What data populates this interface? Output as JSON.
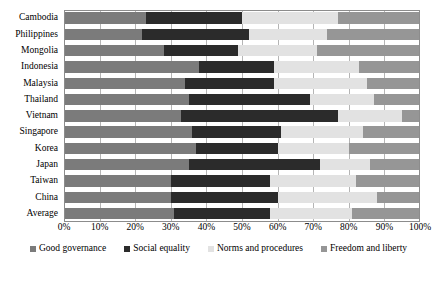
{
  "chart_data": {
    "type": "bar",
    "orientation": "horizontal",
    "stacked": true,
    "normalized_percent": true,
    "title": "",
    "subtitle": "",
    "xlabel": "",
    "ylabel": "",
    "xlim": [
      0,
      100
    ],
    "xtick_labels": [
      "0%",
      "10%",
      "20%",
      "30%",
      "40%",
      "50%",
      "60%",
      "70%",
      "80%",
      "90%",
      "100%"
    ],
    "xtick_values": [
      0,
      10,
      20,
      30,
      40,
      50,
      60,
      70,
      80,
      90,
      100
    ],
    "grid": "vertical",
    "legend_position": "bottom",
    "categories": [
      "Cambodia",
      "Philippines",
      "Mongolia",
      "Indonesia",
      "Malaysia",
      "Thailand",
      "Vietnam",
      "Singapore",
      "Korea",
      "Japan",
      "Taiwan",
      "China",
      "Average"
    ],
    "series": [
      {
        "name": "Good governance",
        "color": "#7b7b7b",
        "values": [
          23,
          22,
          28,
          38,
          34,
          35,
          33,
          36,
          37,
          35,
          30,
          30,
          31
        ]
      },
      {
        "name": "Social equality",
        "color": "#2b2b2b",
        "values": [
          27,
          30,
          21,
          21,
          25,
          34,
          44,
          25,
          23,
          37,
          28,
          30,
          27
        ]
      },
      {
        "name": "Norms and procedures",
        "color": "#e2e2e2",
        "values": [
          27,
          22,
          22,
          24,
          26,
          18,
          18,
          23,
          20,
          14,
          24,
          28,
          23
        ]
      },
      {
        "name": "Freedom and liberty",
        "color": "#969696",
        "values": [
          23,
          26,
          29,
          17,
          15,
          13,
          5,
          16,
          20,
          14,
          18,
          12,
          19
        ]
      }
    ]
  },
  "legend": {
    "items": [
      {
        "label": "Good governance",
        "color": "#7b7b7b"
      },
      {
        "label": "Social equality",
        "color": "#2b2b2b"
      },
      {
        "label": "Norms and procedures",
        "color": "#e2e2e2"
      },
      {
        "label": "Freedom and liberty",
        "color": "#969696"
      }
    ]
  }
}
